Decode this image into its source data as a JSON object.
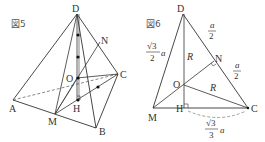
{
  "figures": [
    {
      "id": "fig5",
      "caption": "図5",
      "points": {
        "A": "A",
        "B": "B",
        "C": "C",
        "D": "D",
        "M": "M",
        "N": "N",
        "O": "O",
        "H": "H"
      }
    },
    {
      "id": "fig6",
      "caption": "図6",
      "points": {
        "D": "D",
        "M": "M",
        "N": "N",
        "O": "O",
        "H": "H",
        "C": "C"
      },
      "labels": {
        "DM_num": "√3",
        "DM_den": "2",
        "DM_var": "a",
        "DN_num": "a",
        "DN_den": "2",
        "NC_num": "a",
        "NC_den": "2",
        "OH": "R",
        "OC": "R",
        "HC_num": "√3",
        "HC_den": "3",
        "HC_var": "a"
      }
    }
  ],
  "colors": {
    "line": "#333333",
    "dashed": "#555555",
    "background": "#ffffff"
  }
}
